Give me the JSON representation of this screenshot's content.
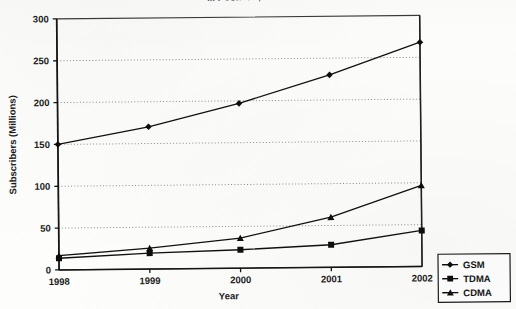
{
  "figure": {
    "title": "... PCS/PCN, and TDMA",
    "title_note": "top of title clipped off by page edge"
  },
  "chart_data": {
    "type": "line",
    "title": "... PCS/PCN, and TDMA",
    "xlabel": "Year",
    "ylabel": "Subscribers (Millions)",
    "categories": [
      "1998",
      "1999",
      "2000",
      "2001",
      "2002"
    ],
    "x": [
      1998,
      1999,
      2000,
      2001,
      2002
    ],
    "ylim": [
      0,
      300
    ],
    "yticks": [
      0,
      50,
      100,
      150,
      200,
      250,
      300
    ],
    "ytick_labels": [
      "0",
      "50",
      "100",
      "150",
      "200",
      "250",
      "300"
    ],
    "grid": "horizontal-dotted",
    "legend_position": "right-bottom-outside",
    "series": [
      {
        "name": "GSM",
        "marker": "diamond",
        "color": "#111111",
        "values": [
          150,
          170,
          197,
          230,
          268
        ]
      },
      {
        "name": "TDMA",
        "marker": "square",
        "color": "#111111",
        "values": [
          14,
          19,
          22,
          27,
          43
        ]
      },
      {
        "name": "CDMA",
        "marker": "triangle",
        "color": "#111111",
        "values": [
          17,
          25,
          36,
          60,
          97
        ]
      }
    ]
  },
  "legend": {
    "entries": [
      {
        "label": "GSM",
        "marker": "diamond"
      },
      {
        "label": "TDMA",
        "marker": "square"
      },
      {
        "label": "CDMA",
        "marker": "triangle"
      }
    ]
  },
  "colors": {
    "ink": "#111111",
    "grid": "#8d8d8d",
    "paper": "#fdfdfc"
  }
}
